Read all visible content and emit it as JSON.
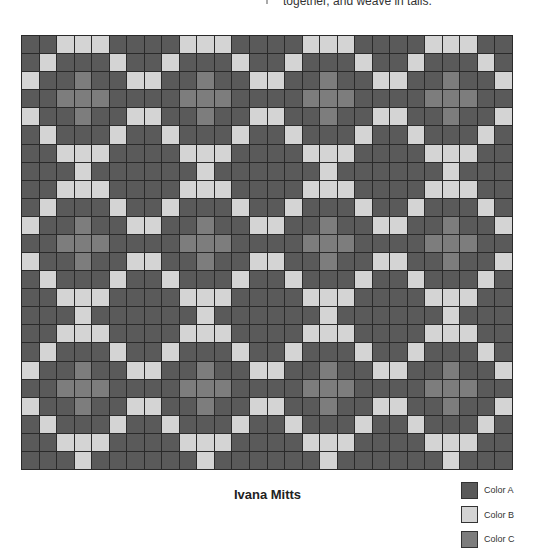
{
  "header": {
    "partial_text": "together, and weave in tails."
  },
  "chart_data": {
    "type": "heatmap",
    "title": "Ivana Mitts",
    "columns": 28,
    "rows": 24,
    "repeat": {
      "width": 7,
      "height": 8
    },
    "motif": [
      "AABBBAA",
      "ABAAABA",
      "BAACAAB",
      "AACCCAA",
      "BAACAAB",
      "ABAAABA",
      "AABBBAA",
      "AAABAAA"
    ],
    "legend": [
      {
        "key": "A",
        "label": "Color A",
        "color": "#5a5a5a"
      },
      {
        "key": "B",
        "label": "Color B",
        "color": "#d4d4d4"
      },
      {
        "key": "C",
        "label": "Color C",
        "color": "#7d7d7d"
      }
    ],
    "grid_line_color": "#2a2a2a"
  },
  "caption": "Ivana Mitts",
  "legend": {
    "items": [
      {
        "label": "Color A",
        "color": "#5a5a5a"
      },
      {
        "label": "Color B",
        "color": "#d4d4d4"
      },
      {
        "label": "Color C",
        "color": "#7d7d7d"
      }
    ]
  }
}
